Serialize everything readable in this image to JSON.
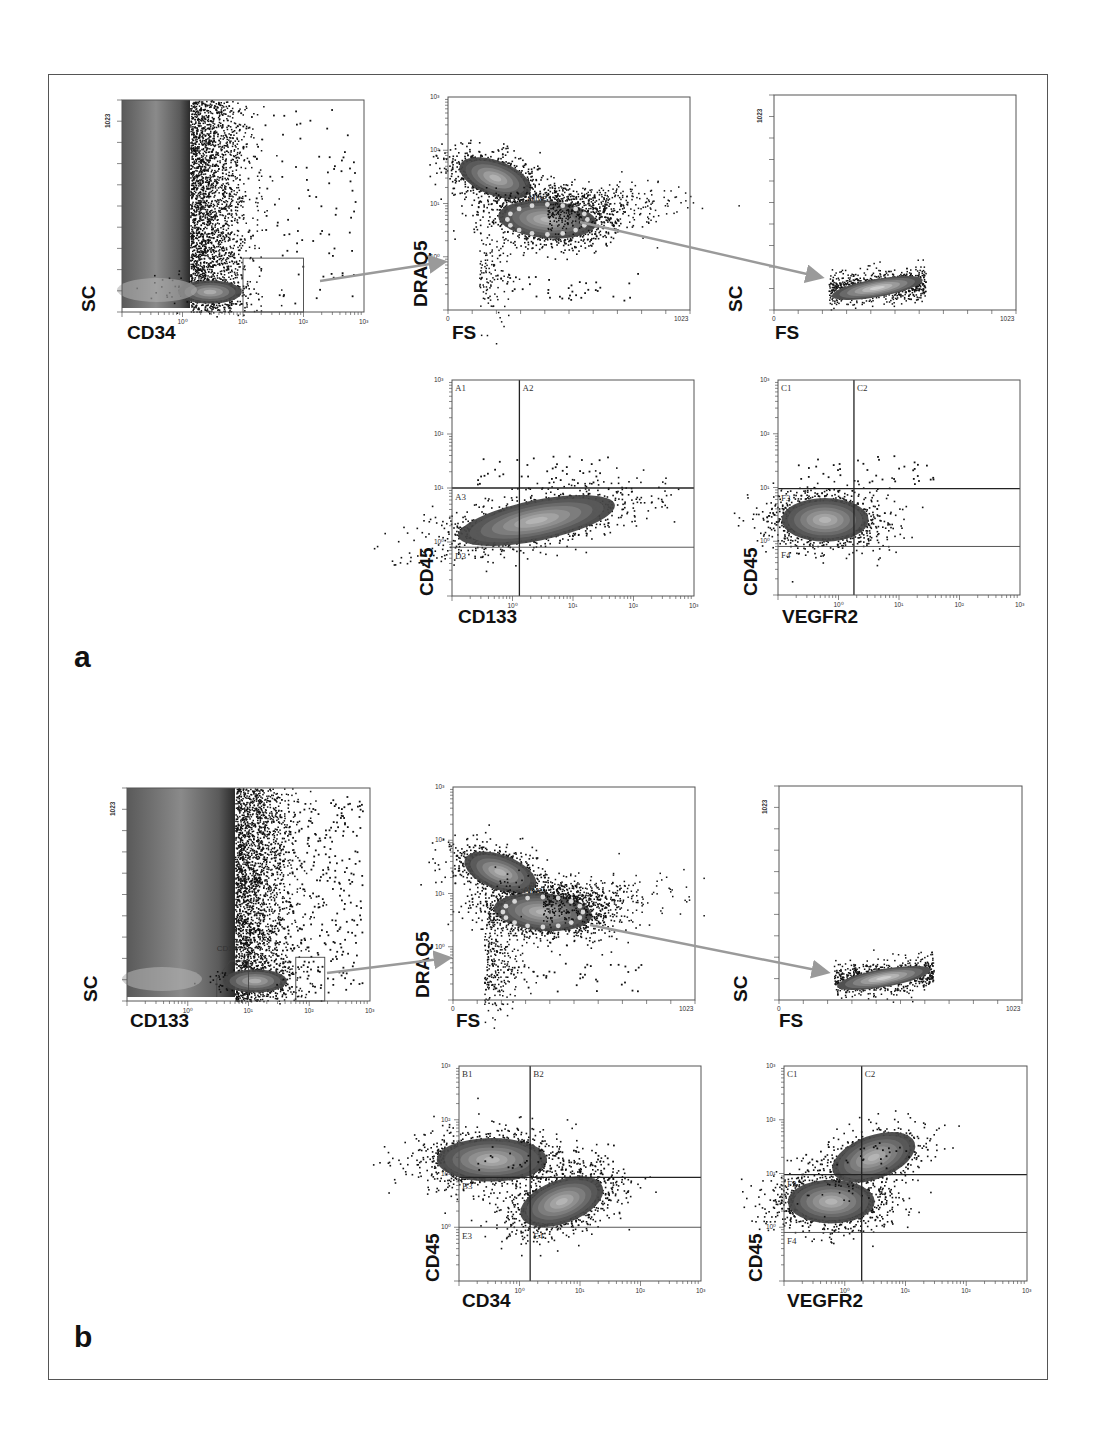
{
  "figure": {
    "panel_labels": [
      "a",
      "b"
    ],
    "arrow_color": "#9a9a9a",
    "gate_dot_color": "#d8d8d8"
  },
  "chart_data": [
    {
      "id": "a1",
      "panel": "a",
      "type": "scatter",
      "title": "",
      "xlabel": "CD34",
      "ylabel": "SC",
      "xscale": "log",
      "xlim": [
        0.1,
        1000
      ],
      "xticks": [
        "10⁰",
        "10¹",
        "10²",
        "10³"
      ],
      "yscale": "linear",
      "ylim": [
        0,
        1023
      ],
      "yticks": [
        "0",
        "1023"
      ],
      "gates": [
        {
          "type": "rectangle",
          "x": [
            10,
            100
          ],
          "y": [
            0,
            260
          ]
        }
      ],
      "populations": [
        {
          "name": "CD34-negative bulk",
          "x_center": 0.35,
          "y_range": [
            0,
            1023
          ],
          "density": "high"
        },
        {
          "name": "dim events",
          "x_center": 3,
          "y_center": 80,
          "density": "medium"
        },
        {
          "name": "CD34+ events",
          "x_range": [
            10,
            700
          ],
          "y_range": [
            20,
            900
          ],
          "density": "sparse"
        }
      ],
      "grid": false
    },
    {
      "id": "a2",
      "panel": "a",
      "type": "scatter",
      "title": "",
      "xlabel": "FS",
      "ylabel": "DRAQ5",
      "xscale": "linear",
      "xlim": [
        0,
        1023
      ],
      "xticks": [
        "0",
        "1023"
      ],
      "yscale": "log",
      "ylim": [
        0.1,
        1000
      ],
      "yticks": [
        "10⁰",
        "10¹",
        "10²",
        "10³"
      ],
      "gates": [
        {
          "type": "ellipse",
          "label": "Alive",
          "x_center": 420,
          "y_center": 5,
          "dashed": true
        }
      ],
      "populations": [
        {
          "name": "high DRAQ5",
          "x_center": 200,
          "y_center": 30,
          "density": "high"
        },
        {
          "name": "Alive",
          "x_center": 420,
          "y_center": 5,
          "density": "high"
        },
        {
          "name": "debris",
          "x_center": 130,
          "y_center": 0.5,
          "density": "sparse"
        }
      ],
      "grid": false
    },
    {
      "id": "a3",
      "panel": "a",
      "type": "scatter",
      "title": "",
      "xlabel": "FS",
      "ylabel": "SC",
      "xscale": "linear",
      "xlim": [
        0,
        1023
      ],
      "xticks": [
        "0",
        "1023"
      ],
      "yscale": "linear",
      "ylim": [
        0,
        1023
      ],
      "yticks": [
        "0",
        "1023"
      ],
      "populations": [
        {
          "name": "gated alive cells",
          "x_center": 420,
          "y_center": 60,
          "x_range": [
            230,
            640
          ],
          "density": "high"
        }
      ],
      "grid": false
    },
    {
      "id": "a4",
      "panel": "a",
      "type": "scatter",
      "title": "",
      "xlabel": "CD133",
      "ylabel": "CD45",
      "xscale": "log",
      "xlim": [
        0.1,
        1000
      ],
      "xticks": [
        "10⁰",
        "10¹",
        "10²",
        "10³"
      ],
      "yscale": "log",
      "ylim": [
        0.1,
        1000
      ],
      "yticks": [
        "10⁰",
        "10¹",
        "10²",
        "10³"
      ],
      "quadrant_labels": [
        "A1",
        "A2",
        "A3",
        "D3"
      ],
      "quadrant_lines": {
        "x": 1.3,
        "y_upper": 10,
        "y_lower": 0.8
      },
      "populations": [
        {
          "name": "main",
          "x_center": 2.5,
          "y_center": 2.5,
          "density": "high"
        }
      ],
      "grid": false
    },
    {
      "id": "a5",
      "panel": "a",
      "type": "scatter",
      "title": "",
      "xlabel": "VEGFR2",
      "ylabel": "CD45",
      "xscale": "log",
      "xlim": [
        0.1,
        1000
      ],
      "xticks": [
        "10⁰",
        "10¹",
        "10²",
        "10³"
      ],
      "yscale": "log",
      "ylim": [
        0.1,
        1000
      ],
      "yticks": [
        "10⁰",
        "10¹",
        "10²",
        "10³"
      ],
      "quadrant_labels": [
        "C1",
        "C2",
        "F3",
        "F4"
      ],
      "quadrant_lines": {
        "x": 1.8,
        "y_upper": 9.5,
        "y_lower": 0.8
      },
      "populations": [
        {
          "name": "main",
          "x_center": 0.6,
          "y_center": 2.5,
          "density": "high"
        }
      ],
      "grid": false
    },
    {
      "id": "b1",
      "panel": "b",
      "type": "scatter",
      "title": "",
      "xlabel": "CD133",
      "ylabel": "SC",
      "xscale": "log",
      "xlim": [
        0.1,
        1000
      ],
      "xticks": [
        "10⁰",
        "10¹",
        "10²",
        "10³"
      ],
      "yscale": "linear",
      "ylim": [
        0,
        1023
      ],
      "yticks": [
        "0",
        "1023"
      ],
      "gates": [
        {
          "type": "polygon",
          "label": "CD1..",
          "x": [
            3,
            10
          ],
          "y": [
            0,
            180
          ]
        },
        {
          "type": "rectangle",
          "x": [
            60,
            180
          ],
          "y": [
            0,
            210
          ]
        }
      ],
      "populations": [
        {
          "name": "CD133-negative bulk",
          "x_center": 0.5,
          "y_range": [
            0,
            1023
          ],
          "density": "high"
        },
        {
          "name": "CD133 dim",
          "x_center": 6,
          "y_center": 80,
          "density": "medium"
        },
        {
          "name": "CD133+ events",
          "x_range": [
            10,
            1000
          ],
          "y_range": [
            10,
            1000
          ],
          "density": "sparse"
        }
      ],
      "grid": false
    },
    {
      "id": "b2",
      "panel": "b",
      "type": "scatter",
      "title": "",
      "xlabel": "FS",
      "ylabel": "DRAQ5",
      "xscale": "linear",
      "xlim": [
        0,
        1023
      ],
      "xticks": [
        "0",
        "1023"
      ],
      "yscale": "log",
      "ylim": [
        0.1,
        1000
      ],
      "yticks": [
        "10⁰",
        "10¹",
        "10²",
        "10³"
      ],
      "gates": [
        {
          "type": "ellipse",
          "label": "Alive",
          "x_center": 380,
          "y_center": 4.5,
          "dashed": true
        }
      ],
      "populations": [
        {
          "name": "high DRAQ5",
          "x_center": 200,
          "y_center": 25,
          "density": "high"
        },
        {
          "name": "Alive",
          "x_center": 380,
          "y_center": 4.5,
          "density": "high"
        },
        {
          "name": "debris",
          "x_center": 120,
          "y_center": 0.4,
          "density": "medium"
        }
      ],
      "grid": false
    },
    {
      "id": "b3",
      "panel": "b",
      "type": "scatter",
      "title": "",
      "xlabel": "FS",
      "ylabel": "SC",
      "xscale": "linear",
      "xlim": [
        0,
        1023
      ],
      "xticks": [
        "0",
        "1023"
      ],
      "yscale": "linear",
      "ylim": [
        0,
        1023
      ],
      "yticks": [
        "0",
        "1023"
      ],
      "populations": [
        {
          "name": "gated alive cells",
          "x_center": 430,
          "y_center": 70,
          "x_range": [
            230,
            650
          ],
          "density": "high"
        }
      ],
      "grid": false
    },
    {
      "id": "b4",
      "panel": "b",
      "type": "scatter",
      "title": "",
      "xlabel": "CD34",
      "ylabel": "CD45",
      "xscale": "log",
      "xlim": [
        0.1,
        1000
      ],
      "xticks": [
        "10⁰",
        "10¹",
        "10²",
        "10³"
      ],
      "yscale": "log",
      "ylim": [
        0.1,
        1000
      ],
      "yticks": [
        "10⁰",
        "10¹",
        "10²",
        "10³"
      ],
      "quadrant_labels": [
        "B1",
        "B2",
        "B3",
        "E3",
        "E4"
      ],
      "quadrant_lines": {
        "x": 1.5,
        "y_upper": 8.5,
        "y_lower": 1.0
      },
      "populations": [
        {
          "name": "CD34-/CD45+",
          "x_center": 0.35,
          "y_center": 18,
          "density": "high"
        },
        {
          "name": "CD34+/CD45 dim",
          "x_center": 5,
          "y_center": 3,
          "density": "high"
        }
      ],
      "grid": false
    },
    {
      "id": "b5",
      "panel": "b",
      "type": "scatter",
      "title": "",
      "xlabel": "VEGFR2",
      "ylabel": "CD45",
      "xscale": "log",
      "xlim": [
        0.1,
        1000
      ],
      "xticks": [
        "10⁰",
        "10¹",
        "10²",
        "10³"
      ],
      "yscale": "log",
      "ylim": [
        0.1,
        1000
      ],
      "yticks": [
        "10⁰",
        "10¹",
        "10²",
        "10³"
      ],
      "quadrant_labels": [
        "C1",
        "C2",
        "F3",
        "F4"
      ],
      "quadrant_lines": {
        "x": 1.9,
        "y_upper": 9.5,
        "y_lower": 0.8
      },
      "populations": [
        {
          "name": "main",
          "x_center": 0.6,
          "y_center": 3,
          "density": "high"
        },
        {
          "name": "VEGFR2+/CD45+",
          "x_center": 3,
          "y_center": 20,
          "density": "medium"
        }
      ],
      "grid": false
    }
  ]
}
